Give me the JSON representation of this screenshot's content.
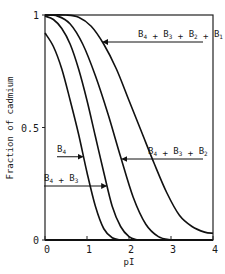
{
  "chart_data": {
    "type": "line",
    "title": "",
    "xlabel": "pI",
    "ylabel": "Fraction of cadmium",
    "xlim": [
      0,
      4
    ],
    "ylim": [
      0,
      1
    ],
    "x_ticks": [
      "0",
      "1",
      "2",
      "3",
      "4"
    ],
    "y_ticks": [
      "0",
      "0.5",
      "1"
    ],
    "grid": false,
    "legend": "annotations with arrows",
    "series": [
      {
        "name": "B4",
        "label_main": "B",
        "label_parts": [
          [
            "B",
            "4"
          ]
        ],
        "x": [
          0,
          0.2,
          0.4,
          0.6,
          0.8,
          1.0,
          1.2,
          1.4,
          1.6,
          1.8
        ],
        "y": [
          0.92,
          0.86,
          0.76,
          0.62,
          0.47,
          0.3,
          0.15,
          0.05,
          0.01,
          0.0
        ]
      },
      {
        "name": "B4 + B3",
        "label_parts": [
          [
            "B",
            "4"
          ],
          [
            "B",
            "3"
          ]
        ],
        "x": [
          0,
          0.2,
          0.4,
          0.6,
          0.8,
          1.0,
          1.2,
          1.4,
          1.6,
          1.8,
          2.0,
          2.2
        ],
        "y": [
          0.995,
          0.98,
          0.94,
          0.87,
          0.76,
          0.62,
          0.46,
          0.3,
          0.15,
          0.06,
          0.015,
          0.0
        ]
      },
      {
        "name": "B4 + B3 + B2",
        "label_parts": [
          [
            "B",
            "4"
          ],
          [
            "B",
            "3"
          ],
          [
            "B",
            "2"
          ]
        ],
        "x": [
          0,
          0.3,
          0.6,
          0.9,
          1.2,
          1.5,
          1.8,
          2.1,
          2.4,
          2.7,
          3.0
        ],
        "y": [
          1.0,
          0.995,
          0.96,
          0.87,
          0.73,
          0.56,
          0.37,
          0.19,
          0.07,
          0.015,
          0.0
        ]
      },
      {
        "name": "B4 + B3 + B2 + B1",
        "label_parts": [
          [
            "B",
            "4"
          ],
          [
            "B",
            "3"
          ],
          [
            "B",
            "2"
          ],
          [
            "B",
            "1"
          ]
        ],
        "x": [
          0,
          0.5,
          0.8,
          1.1,
          1.4,
          1.7,
          2.0,
          2.3,
          2.6,
          2.9,
          3.2,
          3.5,
          3.8,
          4.0
        ],
        "y": [
          1.0,
          1.0,
          0.99,
          0.95,
          0.87,
          0.76,
          0.62,
          0.48,
          0.34,
          0.21,
          0.11,
          0.06,
          0.035,
          0.03
        ]
      }
    ],
    "annotations": [
      {
        "series": "B4",
        "text": "B4",
        "arrow_to_y": 0.37
      },
      {
        "series": "B4 + B3",
        "text": "B4 + B3",
        "arrow_to_y": 0.24
      },
      {
        "series": "B4 + B3 + B2",
        "text": "B4 + B3 + B2",
        "arrow_to_y": 0.36
      },
      {
        "series": "B4 + B3 + B2 + B1",
        "text": "B4 + B3 + B2 + B1",
        "arrow_to_y": 0.88
      }
    ]
  }
}
